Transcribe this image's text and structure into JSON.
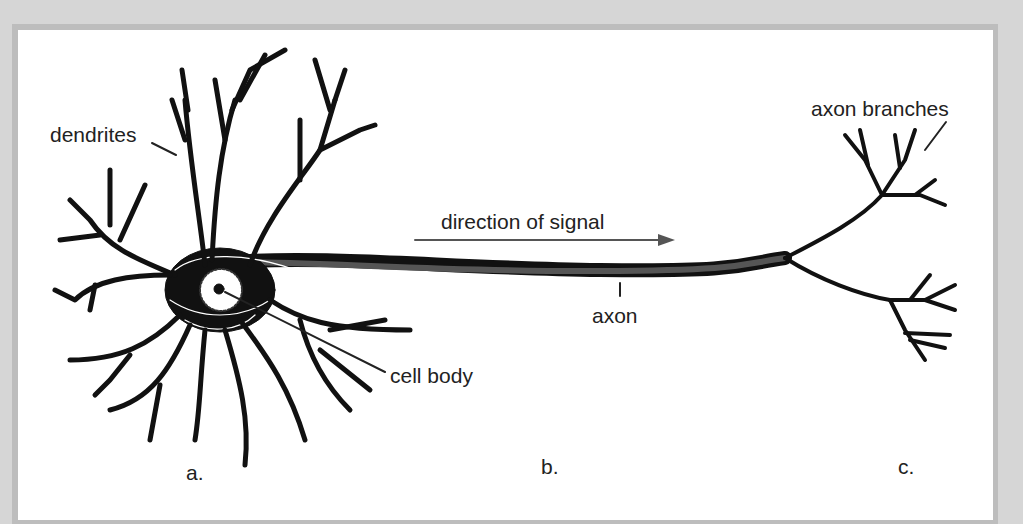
{
  "figure": {
    "labels": {
      "dendrites": "dendrites",
      "cell_body": "cell body",
      "axon": "axon",
      "axon_branches": "axon branches",
      "direction": "direction of signal"
    },
    "panels": [
      "a.",
      "b.",
      "c."
    ],
    "colors": {
      "background": "#d6d6d6",
      "panel": "#ffffff",
      "ink": "#111111",
      "text": "#222222",
      "arrow": "#555555"
    }
  }
}
